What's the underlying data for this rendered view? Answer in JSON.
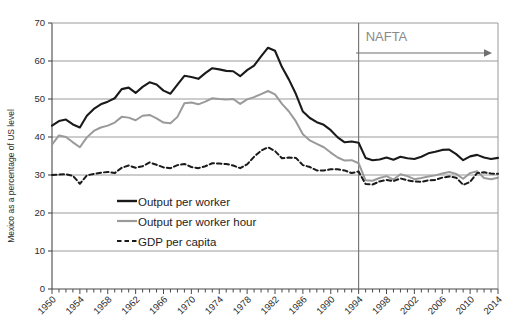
{
  "chart_data": {
    "type": "line",
    "title": "",
    "xlabel": "",
    "ylabel": "Mexico as a percentage of US level",
    "xlim": [
      1950,
      2014
    ],
    "ylim": [
      0,
      70
    ],
    "grid": true,
    "legend_position": "inside-lower-left",
    "y_ticks": [
      "0",
      "10",
      "20",
      "30",
      "40",
      "50",
      "60",
      "70"
    ],
    "x_ticks": [
      "1950",
      "1954",
      "1958",
      "1962",
      "1966",
      "1970",
      "1974",
      "1978",
      "1982",
      "1986",
      "1990",
      "1994",
      "1998",
      "2002",
      "2006",
      "2010",
      "2014"
    ],
    "x": [
      1950,
      1951,
      1952,
      1953,
      1954,
      1955,
      1956,
      1957,
      1958,
      1959,
      1960,
      1961,
      1962,
      1963,
      1964,
      1965,
      1966,
      1967,
      1968,
      1969,
      1970,
      1971,
      1972,
      1973,
      1974,
      1975,
      1976,
      1977,
      1978,
      1979,
      1980,
      1981,
      1982,
      1983,
      1984,
      1985,
      1986,
      1987,
      1988,
      1989,
      1990,
      1991,
      1992,
      1993,
      1994,
      1995,
      1996,
      1997,
      1998,
      1999,
      2000,
      2001,
      2002,
      2003,
      2004,
      2005,
      2006,
      2007,
      2008,
      2009,
      2010,
      2011,
      2012,
      2013,
      2014
    ],
    "annotations": [
      {
        "name": "nafta",
        "label": "NAFTA",
        "x": 1994,
        "type": "vertical-line-with-arrow",
        "color": "#8a8a8a"
      }
    ],
    "series": [
      {
        "name": "Output per worker",
        "key": "output_per_worker",
        "color": "#1a1a1a",
        "style": "solid",
        "width": 2.1,
        "values": [
          43.0,
          44.2,
          44.6,
          43.3,
          42.5,
          45.6,
          47.4,
          48.6,
          49.3,
          50.2,
          52.6,
          53.0,
          51.6,
          53.2,
          54.4,
          53.8,
          52.2,
          51.4,
          53.8,
          56.1,
          55.8,
          55.3,
          56.8,
          58.1,
          57.8,
          57.4,
          57.3,
          56.0,
          57.6,
          58.8,
          61.2,
          63.5,
          62.7,
          58.4,
          55.1,
          51.3,
          46.7,
          45.0,
          43.9,
          43.2,
          41.8,
          39.9,
          38.6,
          38.8,
          38.5,
          34.5,
          33.9,
          34.1,
          34.6,
          34.0,
          34.8,
          34.4,
          34.2,
          34.8,
          35.7,
          36.1,
          36.6,
          36.7,
          35.5,
          33.9,
          34.9,
          35.3,
          34.6,
          34.2,
          34.5
        ]
      },
      {
        "name": "Output per worker hour",
        "key": "output_per_worker_hour",
        "color": "#9a9a9a",
        "style": "solid",
        "width": 2.0,
        "values": [
          38.0,
          40.4,
          40.0,
          38.6,
          37.3,
          39.9,
          41.6,
          42.5,
          43.0,
          43.8,
          45.3,
          45.1,
          44.4,
          45.6,
          45.8,
          44.9,
          43.8,
          43.6,
          45.3,
          48.9,
          49.1,
          48.6,
          49.3,
          50.2,
          50.0,
          49.9,
          50.0,
          48.7,
          49.9,
          50.5,
          51.3,
          52.1,
          51.2,
          48.7,
          46.7,
          44.1,
          40.7,
          39.1,
          38.2,
          37.3,
          35.9,
          34.6,
          33.8,
          33.9,
          33.1,
          28.6,
          28.5,
          29.2,
          29.7,
          28.8,
          30.2,
          29.7,
          28.9,
          29.2,
          29.6,
          29.9,
          30.4,
          30.8,
          30.3,
          29.0,
          30.5,
          31.0,
          29.2,
          28.9,
          29.3
        ]
      },
      {
        "name": "GDP per capita",
        "key": "gdp_per_capita",
        "color": "#1a1a1a",
        "style": "dashed",
        "width": 2.0,
        "values": [
          30.0,
          30.1,
          30.2,
          29.8,
          27.7,
          29.9,
          30.3,
          30.6,
          30.8,
          30.5,
          31.9,
          32.5,
          31.9,
          32.3,
          33.3,
          32.7,
          32.0,
          31.8,
          32.6,
          32.9,
          32.1,
          31.8,
          32.3,
          33.1,
          33.0,
          32.9,
          32.5,
          31.8,
          32.8,
          34.8,
          36.4,
          37.3,
          36.3,
          34.4,
          34.6,
          34.5,
          32.6,
          32.1,
          31.2,
          31.2,
          31.5,
          31.5,
          31.2,
          30.5,
          30.9,
          27.6,
          27.5,
          28.3,
          28.7,
          28.4,
          29.1,
          28.6,
          28.3,
          28.2,
          28.6,
          28.7,
          29.3,
          29.6,
          29.3,
          27.4,
          28.2,
          30.5,
          30.7,
          30.4,
          30.3
        ]
      }
    ]
  },
  "legend": {
    "items": [
      {
        "label": "Output per worker",
        "style": "solid",
        "color": "#1a1a1a"
      },
      {
        "label": "Output per worker hour",
        "style": "solid",
        "color": "#9a9a9a"
      },
      {
        "label": "GDP per capita",
        "style": "dashed",
        "color": "#1a1a1a"
      }
    ]
  },
  "colors": {
    "grid": "#9a9a9a",
    "axis": "#4a4a4a",
    "black_series": "#1a1a1a",
    "gray_series": "#9a9a9a",
    "annotation": "#8a8a8a",
    "background": "#ffffff"
  }
}
